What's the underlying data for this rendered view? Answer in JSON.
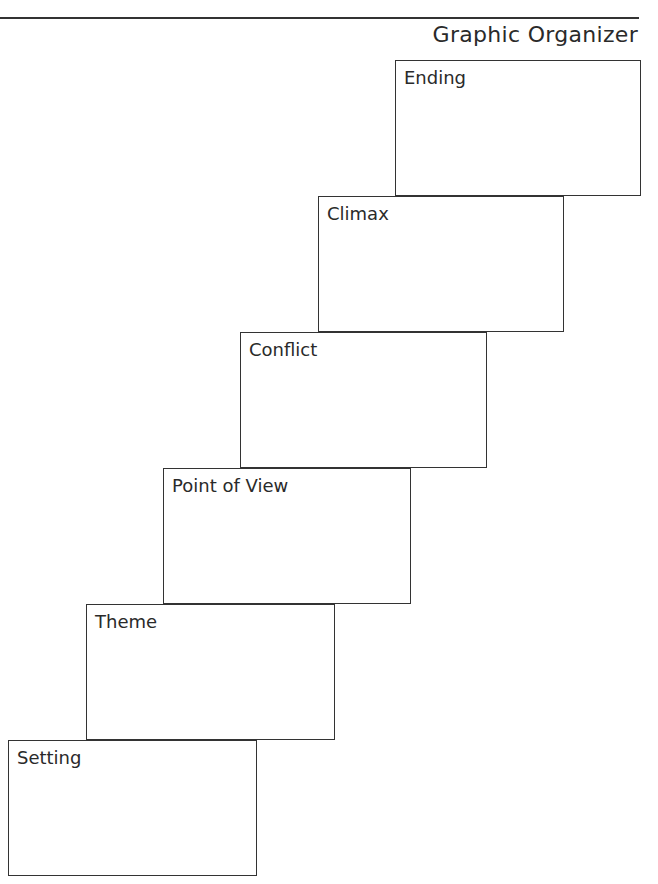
{
  "header": {
    "title": "Graphic Organizer"
  },
  "boxes": [
    {
      "label": "Ending",
      "x": 395,
      "y": 60,
      "w": 246,
      "h": 136
    },
    {
      "label": "Climax",
      "x": 318,
      "y": 196,
      "w": 246,
      "h": 136
    },
    {
      "label": "Conflict",
      "x": 240,
      "y": 332,
      "w": 247,
      "h": 136
    },
    {
      "label": "Point of View",
      "x": 163,
      "y": 468,
      "w": 248,
      "h": 136
    },
    {
      "label": "Theme",
      "x": 86,
      "y": 604,
      "w": 249,
      "h": 136
    },
    {
      "label": "Setting",
      "x": 8,
      "y": 740,
      "w": 249,
      "h": 136
    }
  ]
}
